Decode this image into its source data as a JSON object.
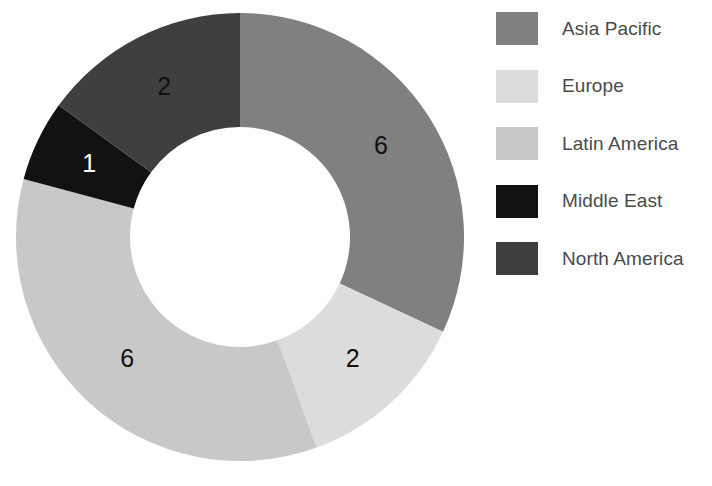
{
  "chart_data": {
    "type": "pie",
    "variant": "donut",
    "title": "",
    "subtitle": "",
    "xlabel": "",
    "ylabel": "",
    "grid": false,
    "legend_position": "right",
    "total": 17,
    "start_angle_deg": 0,
    "direction": "clockwise",
    "inner_radius_ratio": 0.49,
    "categories": [
      "Asia Pacific",
      "Europe",
      "Latin America",
      "Middle East",
      "North America"
    ],
    "values": [
      6,
      2,
      6,
      1,
      2
    ],
    "labels": [
      "6",
      "2",
      "6",
      "1",
      "2"
    ],
    "colors": [
      "#808080",
      "#dcdcdc",
      "#c8c8c8",
      "#121212",
      "#3f3f3f"
    ],
    "label_colors": [
      "#111111",
      "#111111",
      "#111111",
      "#ffffff",
      "#111111"
    ],
    "slices": [
      {
        "name": "Asia Pacific",
        "value": 6,
        "label": "6",
        "color": "#808080",
        "label_color": "#111111",
        "start_deg": 0,
        "end_deg": 115
      },
      {
        "name": "Europe",
        "value": 2,
        "label": "2",
        "color": "#dcdcdc",
        "label_color": "#111111",
        "start_deg": 115,
        "end_deg": 160
      },
      {
        "name": "Latin America",
        "value": 6,
        "label": "6",
        "color": "#c8c8c8",
        "label_color": "#111111",
        "start_deg": 160,
        "end_deg": 285
      },
      {
        "name": "Middle East",
        "value": 1,
        "label": "1",
        "color": "#121212",
        "label_color": "#ffffff",
        "start_deg": 285,
        "end_deg": 306
      },
      {
        "name": "North America",
        "value": 2,
        "label": "2",
        "color": "#3f3f3f",
        "label_color": "#111111",
        "start_deg": 306,
        "end_deg": 360
      }
    ]
  },
  "legend": {
    "items": [
      {
        "label": "Asia Pacific",
        "color": "#808080"
      },
      {
        "label": "Europe",
        "color": "#dcdcdc"
      },
      {
        "label": "Latin America",
        "color": "#c8c8c8"
      },
      {
        "label": "Middle East",
        "color": "#121212"
      },
      {
        "label": "North America",
        "color": "#3f3f3f"
      }
    ]
  },
  "geometry": {
    "center_x": 240,
    "center_y": 237,
    "outer_radius": 224,
    "inner_radius": 110,
    "label_radius": 167
  }
}
